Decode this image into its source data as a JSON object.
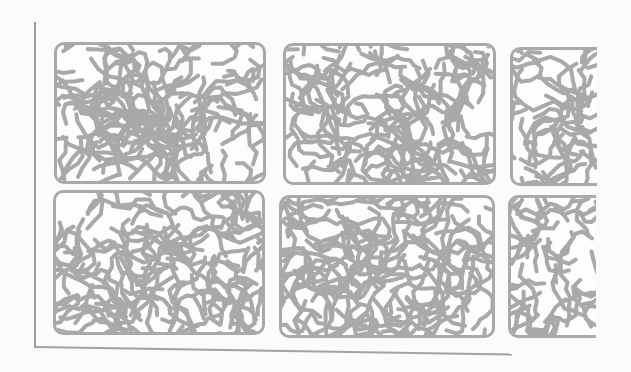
{
  "figure": {
    "colors": {
      "background": "#fbfbfb",
      "stripe": "#a9a9a9",
      "frame": "#a9a9a9",
      "axis": "#9e9e9e"
    },
    "panels": [
      {
        "row": 1,
        "col": 1,
        "x": 54,
        "y": 42,
        "w": 212,
        "h": 142,
        "seed": 11,
        "cropped": false
      },
      {
        "row": 1,
        "col": 2,
        "x": 283,
        "y": 43,
        "w": 213,
        "h": 142,
        "seed": 23,
        "cropped": false
      },
      {
        "row": 1,
        "col": 3,
        "x": 510,
        "y": 47,
        "w": 87,
        "h": 139,
        "seed": 37,
        "cropped": true
      },
      {
        "row": 2,
        "col": 1,
        "x": 53,
        "y": 190,
        "w": 212,
        "h": 145,
        "seed": 41,
        "cropped": false
      },
      {
        "row": 2,
        "col": 2,
        "x": 279,
        "y": 195,
        "w": 216,
        "h": 143,
        "seed": 53,
        "cropped": false
      },
      {
        "row": 2,
        "col": 3,
        "x": 508,
        "y": 195,
        "w": 88,
        "h": 143,
        "seed": 67,
        "cropped": true
      }
    ]
  }
}
